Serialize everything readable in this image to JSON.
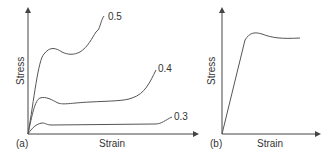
{
  "panels": [
    {
      "label": "(a)",
      "xlabel": "Strain",
      "ylabel": "Stress",
      "curves": [
        {
          "label": "0.5"
        },
        {
          "label": "0.4"
        },
        {
          "label": "0.3"
        }
      ]
    },
    {
      "label": "(b)",
      "xlabel": "Strain",
      "ylabel": "Stress"
    }
  ],
  "colors": {
    "line": "#555555",
    "text": "#333333"
  }
}
